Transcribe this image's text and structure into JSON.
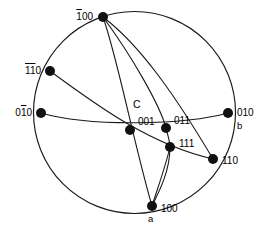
{
  "figure": {
    "type": "stereographic-projection",
    "title": "",
    "background_color": "#ffffff",
    "line_color": "#1a1a1a",
    "dot_color": "#111111"
  },
  "primitive_circle": {
    "center_x": 134.5,
    "center_y": 112.5,
    "radius": 101
  },
  "poles": [
    {
      "id": "bar100",
      "label_parts": [
        {
          "text": "1",
          "overbar": true
        },
        {
          "text": "00",
          "overbar": false
        }
      ],
      "label_plain": "-100",
      "x": 103,
      "y": 17,
      "dot_r": 5,
      "label_x": 93,
      "label_y": 17,
      "anchor": "end"
    },
    {
      "id": "bar1bar10",
      "label_parts": [
        {
          "text": "1",
          "overbar": true
        },
        {
          "text": "1",
          "overbar": true
        },
        {
          "text": "0",
          "overbar": false
        }
      ],
      "label_plain": "-1-10",
      "x": 50,
      "y": 71,
      "dot_r": 5,
      "label_x": 41,
      "label_y": 71,
      "anchor": "end"
    },
    {
      "id": "0bar10",
      "label_parts": [
        {
          "text": "0",
          "overbar": false
        },
        {
          "text": "1",
          "overbar": true
        },
        {
          "text": "0",
          "overbar": false
        }
      ],
      "label_plain": "0-10",
      "x": 41,
      "y": 113,
      "dot_r": 5,
      "label_x": 32,
      "label_y": 113,
      "anchor": "end"
    },
    {
      "id": "001",
      "label_parts": [
        {
          "text": "001",
          "overbar": false
        }
      ],
      "label_plain": "001",
      "x": 130,
      "y": 130,
      "dot_r": 5,
      "label_x": 138,
      "label_y": 122,
      "anchor": "start"
    },
    {
      "id": "011",
      "label_parts": [
        {
          "text": "011",
          "overbar": false
        }
      ],
      "label_plain": "011",
      "x": 166,
      "y": 128,
      "dot_r": 5,
      "label_x": 174,
      "label_y": 121,
      "anchor": "start"
    },
    {
      "id": "010",
      "label_parts": [
        {
          "text": "010",
          "overbar": false
        }
      ],
      "label_plain": "010",
      "x": 228,
      "y": 113,
      "dot_r": 5,
      "label_x": 237,
      "label_y": 113,
      "anchor": "start"
    },
    {
      "id": "111",
      "label_parts": [
        {
          "text": "111",
          "overbar": false
        }
      ],
      "label_plain": "111",
      "x": 170,
      "y": 147,
      "dot_r": 5,
      "label_x": 179,
      "label_y": 144,
      "anchor": "start"
    },
    {
      "id": "110",
      "label_parts": [
        {
          "text": "110",
          "overbar": false
        }
      ],
      "label_plain": "110",
      "x": 213,
      "y": 159,
      "dot_r": 5,
      "label_x": 222,
      "label_y": 161,
      "anchor": "start"
    },
    {
      "id": "100",
      "label_parts": [
        {
          "text": "100",
          "overbar": false
        }
      ],
      "label_plain": "100",
      "x": 152,
      "y": 206,
      "dot_r": 5,
      "label_x": 161,
      "label_y": 209,
      "anchor": "start"
    }
  ],
  "axis_annotations": [
    {
      "id": "axis-a",
      "text": "a",
      "x": 148,
      "y": 219
    },
    {
      "id": "axis-b",
      "text": "b",
      "x": 237,
      "y": 126
    }
  ],
  "center_annotation": {
    "id": "center-c",
    "text": "C",
    "x": 133,
    "y": 105
  },
  "arcs": [
    {
      "id": "arc-bar100-to-100",
      "d": "M 103 17 C 118 60, 133 140, 152 206"
    },
    {
      "id": "arc-bar100-to-110",
      "d": "M 103 17 C 140 45, 175 95, 213 159"
    },
    {
      "id": "arc-bar100-to-011-100",
      "d": "M 103 17 C 131 55, 160 105, 166 128 C 169 140, 170 142, 170 147 C 170 170, 160 190, 152 206"
    },
    {
      "id": "arc-0bar10-to-010",
      "d": "M 41 113 C 90 127, 185 125, 228 113"
    },
    {
      "id": "arc-bar1bar10-to-110",
      "d": "M 50 71 C 95 104, 150 145, 213 159"
    },
    {
      "id": "arc-111-to-100-vertical",
      "d": "M 170 147 C 166 165, 157 190, 152 206"
    }
  ]
}
